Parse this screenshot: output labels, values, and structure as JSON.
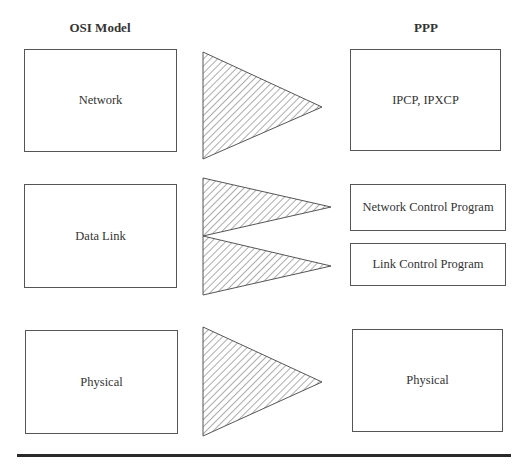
{
  "diagram": {
    "title_left": "OSI Model",
    "title_right": "PPP",
    "osi_layers": [
      {
        "id": "network",
        "label": "Network"
      },
      {
        "id": "datalink",
        "label": "Data Link"
      },
      {
        "id": "physical",
        "label": "Physical"
      }
    ],
    "ppp_components": [
      {
        "id": "ipcp",
        "label": "IPCP, IPXCP",
        "maps_from": "network"
      },
      {
        "id": "ncp",
        "label": "Network Control Program",
        "maps_from": "datalink"
      },
      {
        "id": "lcp",
        "label": "Link Control Program",
        "maps_from": "datalink"
      },
      {
        "id": "physical",
        "label": "Physical",
        "maps_from": "physical"
      }
    ],
    "mappings": [
      {
        "from": "Network",
        "to": "IPCP, IPXCP"
      },
      {
        "from": "Data Link",
        "to": "Network Control Program"
      },
      {
        "from": "Data Link",
        "to": "Link Control Program"
      },
      {
        "from": "Physical",
        "to": "Physical"
      }
    ],
    "arrow_style": "hatched-triangle",
    "colors": {
      "stroke": "#555555",
      "hatch": "#666666",
      "rule": "#2a2a2a",
      "background": "#ffffff"
    }
  }
}
